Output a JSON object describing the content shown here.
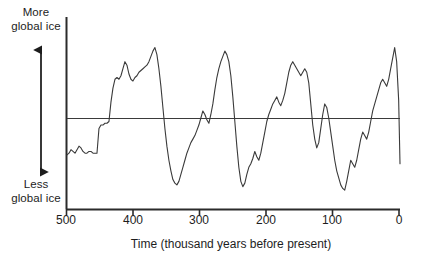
{
  "axis_labels": {
    "top_left": "More\nglobal ice",
    "bottom_left": "Less\nglobal ice",
    "x_title": "Time (thousand years before present)"
  },
  "colors": {
    "line": "#3a3a3a",
    "axis": "#2b2b2b",
    "background": "#ffffff",
    "text": "#1d1d1d"
  },
  "chart_data": {
    "type": "line",
    "title": "",
    "subtitle": "",
    "xlabel": "Time (thousand years before present)",
    "ylabel": "Global ice volume",
    "ylabel_high": "More global ice",
    "ylabel_low": "Less global ice",
    "grid": false,
    "legend": "none",
    "x_axis_reversed": true,
    "xlim": [
      500,
      0
    ],
    "xticks": [
      500,
      400,
      300,
      200,
      100,
      0
    ],
    "xtick_labels": [
      "500",
      "400",
      "300",
      "200",
      "100",
      "0"
    ],
    "ylim": [
      0,
      100
    ],
    "yticks": [],
    "ytick_labels": [],
    "reference_line_y": 58,
    "annotations": [
      {
        "name": "vertical-double-arrow",
        "meaning": "increasing global ice upward"
      }
    ],
    "series": [
      {
        "name": "Global ice volume",
        "x": [
          500,
          497,
          494,
          491,
          488,
          485,
          482,
          479,
          476,
          473,
          470,
          467,
          464,
          461,
          458,
          455,
          452,
          449,
          446,
          443,
          440,
          437,
          434,
          431,
          428,
          425,
          422,
          419,
          416,
          413,
          410,
          407,
          404,
          401,
          398,
          395,
          392,
          389,
          386,
          383,
          380,
          377,
          374,
          371,
          368,
          365,
          362,
          359,
          356,
          353,
          350,
          347,
          344,
          341,
          338,
          335,
          332,
          329,
          326,
          323,
          320,
          317,
          314,
          311,
          308,
          305,
          302,
          299,
          296,
          293,
          290,
          287,
          284,
          281,
          278,
          275,
          272,
          269,
          266,
          263,
          260,
          257,
          254,
          251,
          248,
          245,
          242,
          239,
          236,
          233,
          230,
          227,
          224,
          221,
          218,
          215,
          212,
          209,
          206,
          203,
          200,
          197,
          194,
          191,
          188,
          185,
          182,
          179,
          176,
          173,
          170,
          167,
          164,
          161,
          158,
          155,
          152,
          149,
          146,
          143,
          140,
          137,
          134,
          131,
          128,
          125,
          122,
          119,
          116,
          113,
          110,
          107,
          104,
          101,
          98,
          95,
          92,
          89,
          86,
          83,
          80,
          77,
          74,
          71,
          68,
          65,
          62,
          59,
          56,
          53,
          50,
          47,
          44,
          41,
          38,
          35,
          32,
          29,
          26,
          23,
          20,
          17,
          14,
          11,
          8,
          5,
          2,
          0
        ],
        "values": [
          29,
          30,
          32,
          31,
          30,
          32,
          34,
          33,
          31,
          30,
          30,
          31,
          31,
          30,
          30,
          30,
          44,
          46,
          46,
          47,
          47,
          48,
          59,
          67,
          72,
          73,
          72,
          74,
          78,
          82,
          80,
          75,
          72,
          71,
          73,
          74,
          76,
          77,
          78,
          79,
          80,
          82,
          85,
          88,
          90,
          86,
          78,
          68,
          56,
          44,
          34,
          26,
          20,
          15,
          13,
          12,
          14,
          18,
          22,
          26,
          30,
          33,
          36,
          38,
          40,
          43,
          46,
          50,
          54,
          52,
          49,
          47,
          52,
          58,
          66,
          73,
          78,
          82,
          85,
          88,
          86,
          82,
          74,
          62,
          48,
          34,
          22,
          14,
          11,
          13,
          18,
          22,
          24,
          27,
          31,
          28,
          26,
          30,
          36,
          42,
          48,
          52,
          55,
          58,
          60,
          62,
          59,
          57,
          60,
          64,
          70,
          76,
          80,
          82,
          80,
          78,
          76,
          74,
          76,
          78,
          76,
          70,
          58,
          46,
          38,
          33,
          36,
          44,
          52,
          58,
          56,
          50,
          42,
          34,
          26,
          20,
          16,
          12,
          10,
          9,
          14,
          20,
          26,
          24,
          22,
          26,
          32,
          38,
          42,
          40,
          38,
          42,
          48,
          54,
          58,
          62,
          66,
          70,
          72,
          70,
          68,
          72,
          78,
          84,
          90,
          82,
          60,
          24
        ]
      }
    ]
  }
}
